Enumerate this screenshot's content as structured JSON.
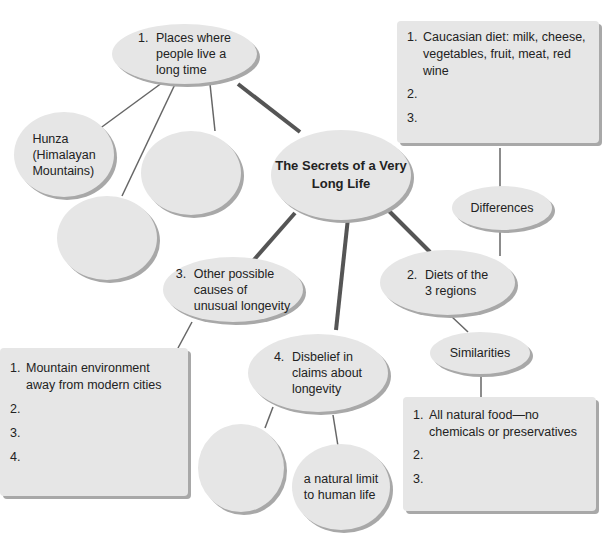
{
  "title": "The Secrets of a Very Long Life",
  "nodes": {
    "places": {
      "num": "1.",
      "text": "Places where people live a long time",
      "lines": [
        "Places where",
        "people live a",
        "long time"
      ]
    },
    "hunza": {
      "lines": [
        "Hunza",
        "(Himalayan",
        "Mountains)"
      ]
    },
    "blank_a": {
      "text": ""
    },
    "blank_b": {
      "text": ""
    },
    "diets": {
      "num": "2.",
      "lines": [
        "Diets of the",
        "3 regions"
      ]
    },
    "differences": {
      "label": "Differences"
    },
    "similarities": {
      "label": "Similarities"
    },
    "causes": {
      "num": "3.",
      "lines": [
        "Other possible",
        "causes of",
        "unusual longevity"
      ]
    },
    "disbelief": {
      "num": "4.",
      "lines": [
        "Disbelief in",
        "claims about",
        "longevity"
      ]
    },
    "blank_c": {
      "text": ""
    },
    "natural_limit": {
      "lines": [
        "a natural limit",
        "to human life"
      ]
    }
  },
  "boxes": {
    "differences_list": {
      "items": [
        {
          "num": "1.",
          "text": "Caucasian diet: milk, cheese, vegetables, fruit, meat, red wine"
        },
        {
          "num": "2.",
          "text": ""
        },
        {
          "num": "3.",
          "text": ""
        }
      ]
    },
    "causes_list": {
      "items": [
        {
          "num": "1.",
          "text": "Mountain environment away from modern cities"
        },
        {
          "num": "2.",
          "text": ""
        },
        {
          "num": "3.",
          "text": ""
        },
        {
          "num": "4.",
          "text": ""
        }
      ]
    },
    "similarities_list": {
      "items": [
        {
          "num": "1.",
          "text": "All natural food—no chemicals or preservatives"
        },
        {
          "num": "2.",
          "text": ""
        },
        {
          "num": "3.",
          "text": ""
        }
      ]
    }
  },
  "colors": {
    "node_fill": "#e6e6e6",
    "node_shadow": "#a8a8a8",
    "thick_line": "#555555",
    "thin_line": "#666666"
  }
}
